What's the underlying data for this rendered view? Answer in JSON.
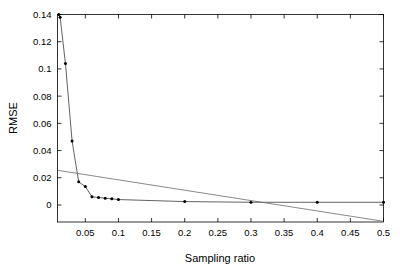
{
  "chart_data": {
    "type": "line",
    "title": "",
    "xlabel": "Sampling ratio",
    "ylabel": "RMSE",
    "xlim": [
      0.008,
      0.5
    ],
    "ylim": [
      -0.0125,
      0.14
    ],
    "grid": false,
    "legend": "none",
    "xticks": [
      0.05,
      0.1,
      0.15,
      0.2,
      0.25,
      0.3,
      0.35,
      0.4,
      0.45,
      0.5
    ],
    "xticklabels": [
      "0.05",
      "0.1",
      "0.15",
      "0.2",
      "0.25",
      "0.3",
      "0.35",
      "0.4",
      "0.45",
      "0.5"
    ],
    "yticks": [
      0,
      0.02,
      0.04,
      0.06,
      0.08,
      0.1,
      0.12,
      0.14
    ],
    "yticklabels": [
      "0",
      "0.02",
      "0.04",
      "0.06",
      "0.08",
      "0.1",
      "0.12",
      "0.14"
    ],
    "series": [
      {
        "name": "rmse-curve",
        "marker": "dot",
        "color": "#3a3a3a",
        "x": [
          0.01,
          0.012,
          0.02,
          0.03,
          0.04,
          0.05,
          0.06,
          0.07,
          0.08,
          0.09,
          0.1,
          0.2,
          0.3,
          0.4,
          0.5
        ],
        "y": [
          0.14,
          0.138,
          0.104,
          0.047,
          0.017,
          0.0135,
          0.006,
          0.0055,
          0.005,
          0.0045,
          0.004,
          0.0025,
          0.002,
          0.002,
          0.002
        ]
      },
      {
        "name": "reference-line",
        "marker": "none",
        "color": "#6b6b6b",
        "x": [
          0.008,
          0.5
        ],
        "y": [
          0.0255,
          -0.012
        ]
      }
    ]
  },
  "axes": {
    "ylabel_text": "RMSE",
    "xlabel_text": "Sampling ratio"
  }
}
